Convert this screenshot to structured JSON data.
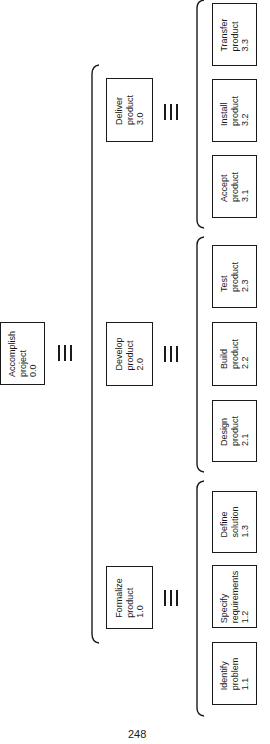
{
  "diagram": {
    "type": "work-breakdown-structure",
    "orientation": "rotated-90-ccw",
    "root": {
      "title": "Accomplish project",
      "line1": "Accomplish",
      "line2": "project",
      "id": "0.0"
    },
    "equivalence_symbol": "≡",
    "level1": [
      {
        "line1": "Deliver",
        "line2": "product",
        "id": "3.0"
      },
      {
        "line1": "Develop",
        "line2": "product",
        "id": "2.0"
      },
      {
        "line1": "Formalize",
        "line2": "product",
        "id": "1.0"
      }
    ],
    "level2": {
      "deliver": [
        {
          "line1": "Transfer",
          "line2": "product",
          "id": "3.3"
        },
        {
          "line1": "Install",
          "line2": "product",
          "id": "3.2"
        },
        {
          "line1": "Accept",
          "line2": "product",
          "id": "3.1"
        }
      ],
      "develop": [
        {
          "line1": "Test",
          "line2": "product",
          "id": "2.3"
        },
        {
          "line1": "Build",
          "line2": "product",
          "id": "2.2"
        },
        {
          "line1": "Design",
          "line2": "product",
          "id": "2.1"
        }
      ],
      "formalize": [
        {
          "line1": "Define",
          "line2": "solution",
          "id": "1.3"
        },
        {
          "line1": "Specify",
          "line2": "requirements",
          "id": "1.2"
        },
        {
          "line1": "Identify",
          "line2": "problem",
          "id": "1.1"
        }
      ]
    }
  },
  "page": {
    "number": "248"
  }
}
